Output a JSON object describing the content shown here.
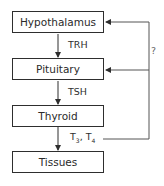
{
  "diagram": {
    "type": "flowchart",
    "nodes": [
      {
        "id": "hypothalamus",
        "label": "Hypothalamus"
      },
      {
        "id": "pituitary",
        "label": "Pituitary"
      },
      {
        "id": "thyroid",
        "label": "Thyroid"
      },
      {
        "id": "tissues",
        "label": "Tissues"
      }
    ],
    "edges": [
      {
        "from": "hypothalamus",
        "to": "pituitary",
        "label": "TRH"
      },
      {
        "from": "pituitary",
        "to": "thyroid",
        "label": "TSH"
      },
      {
        "from": "thyroid",
        "to": "tissues",
        "label": "T3, T4"
      },
      {
        "from": "thyroid",
        "to": "pituitary",
        "label": "feedback"
      },
      {
        "from": "thyroid",
        "to": "hypothalamus",
        "label": "?"
      }
    ],
    "edge_labels": {
      "trh": "TRH",
      "tsh": "TSH",
      "t3": "T",
      "t3_sub": "3",
      "sep": ", T",
      "t4_sub": "4",
      "question": "?"
    }
  }
}
